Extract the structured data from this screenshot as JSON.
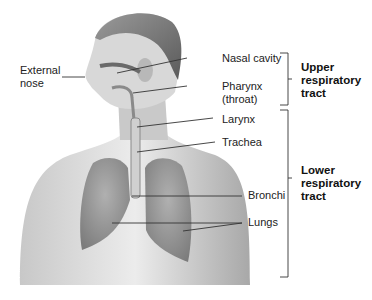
{
  "diagram": {
    "labels": {
      "external_nose": {
        "line1": "External",
        "line2": "nose"
      },
      "nasal_cavity": "Nasal cavity",
      "pharynx": {
        "line1": "Pharynx",
        "line2": "(throat)"
      },
      "larynx": "Larynx",
      "trachea": "Trachea",
      "bronchi": "Bronchi",
      "lungs": "Lungs"
    },
    "groups": {
      "upper": {
        "line1": "Upper",
        "line2": "respiratory",
        "line3": "tract"
      },
      "lower": {
        "line1": "Lower",
        "line2": "respiratory",
        "line3": "tract"
      }
    },
    "colors": {
      "line": "#333333",
      "skin_light": "#e6e6e6",
      "skin_mid": "#b5b5b5",
      "skin_dark": "#7a7a7a",
      "lung": "#9a9a9a"
    }
  }
}
